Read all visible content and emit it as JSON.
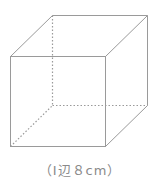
{
  "figure": {
    "shape": "cube",
    "caption": "（Ⅰ辺８cm）",
    "caption_text": "(1辺8cm)",
    "edge_length_cm": 8,
    "line_color": "#9a9a9a",
    "hidden_edges_style": "dotted"
  }
}
